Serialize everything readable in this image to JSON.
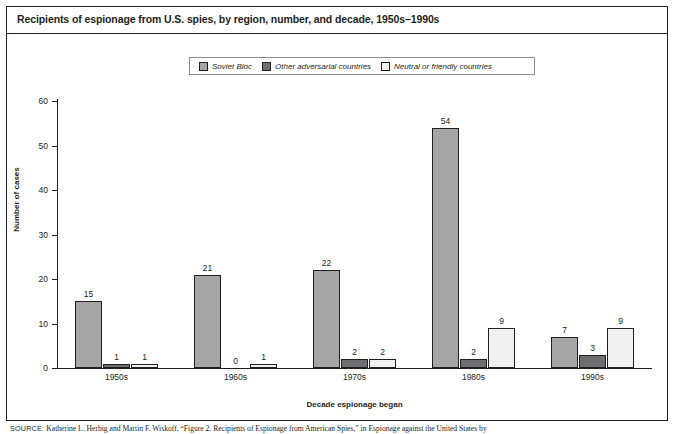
{
  "figure": {
    "title": "Recipients of espionage from U.S. spies, by region, number, and decade, 1950s–1990s",
    "source_label": "SOURCE:",
    "source_text": "Katherine L. Herbig and Martin F. Wiskoff, “Figure 2. Recipients of Espionage from American Spies,” in Espionage against the United States by"
  },
  "chart_data": {
    "type": "bar",
    "title": "Recipients of espionage from U.S. spies, by region, number, and decade, 1950s–1990s",
    "xlabel": "Decade espionage began",
    "ylabel": "Number of cases",
    "categories": [
      "1950s",
      "1960s",
      "1970s",
      "1980s",
      "1990s"
    ],
    "series": [
      {
        "name": "Soviet Bloc",
        "color": "#a6a6a6",
        "values": [
          15,
          21,
          22,
          54,
          7
        ]
      },
      {
        "name": "Other adversarial countries",
        "color": "#6d6e71",
        "values": [
          1,
          0,
          2,
          2,
          3
        ]
      },
      {
        "name": "Neutral or friendly countries",
        "color": "#f1f1f1",
        "values": [
          1,
          1,
          2,
          9,
          9
        ]
      }
    ],
    "ylim": [
      0,
      60
    ],
    "yticks": [
      0,
      10,
      20,
      30,
      40,
      50,
      60
    ],
    "grid": false,
    "legend_position": "top-center"
  }
}
